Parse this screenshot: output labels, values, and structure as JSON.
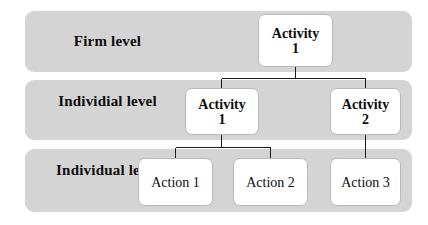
{
  "diagram": {
    "colors": {
      "band": "#d4d4d4",
      "box_fill": "#ffffff",
      "box_border": "#b9b9b9",
      "line": "#1a1a1a",
      "text": "#0d0d0d",
      "background": "#ffffff"
    },
    "levels": [
      {
        "id": "firm",
        "label": "Firm level"
      },
      {
        "id": "individial",
        "label_line1": "Individial",
        "label_line2": "level"
      },
      {
        "id": "individual",
        "label_line1": "Individual",
        "label_line2": "level"
      }
    ],
    "nodes": [
      {
        "id": "firm-activity-1",
        "type": "activity",
        "line1": "Activity",
        "line2": "1",
        "level": "firm"
      },
      {
        "id": "mid-activity-1",
        "type": "activity",
        "line1": "Activity",
        "line2": "1",
        "level": "individial"
      },
      {
        "id": "mid-activity-2",
        "type": "activity",
        "line1": "Activity",
        "line2": "2",
        "level": "individial"
      },
      {
        "id": "action-1",
        "type": "action",
        "label": "Action 1",
        "level": "individual"
      },
      {
        "id": "action-2",
        "type": "action",
        "label": "Action 2",
        "level": "individual"
      },
      {
        "id": "action-3",
        "type": "action",
        "label": "Action 3",
        "level": "individual"
      }
    ],
    "edges": [
      {
        "from": "firm-activity-1",
        "to": "mid-activity-1"
      },
      {
        "from": "firm-activity-1",
        "to": "mid-activity-2"
      },
      {
        "from": "mid-activity-1",
        "to": "action-1"
      },
      {
        "from": "mid-activity-1",
        "to": "action-2"
      },
      {
        "from": "mid-activity-2",
        "to": "action-3"
      }
    ]
  }
}
